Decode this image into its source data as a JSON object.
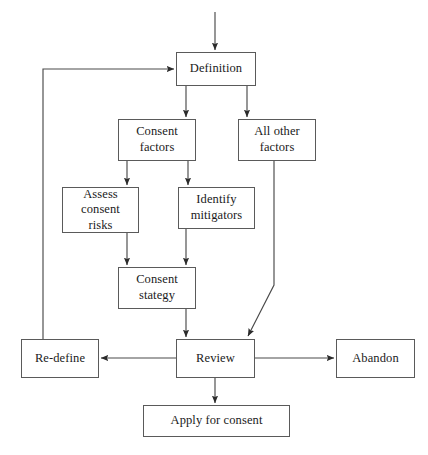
{
  "diagram": {
    "type": "flowchart",
    "orientation": "top-to-bottom",
    "nodes": [
      {
        "id": "definition",
        "label": "Definition",
        "x": 176,
        "y": 52,
        "w": 80,
        "h": 34
      },
      {
        "id": "consent-factors",
        "label": "Consent\nfactors",
        "x": 118,
        "y": 119,
        "w": 78,
        "h": 42
      },
      {
        "id": "all-other-factors",
        "label": "All other\nfactors",
        "x": 238,
        "y": 119,
        "w": 78,
        "h": 42
      },
      {
        "id": "assess-risks",
        "label": "Assess\nconsent\nrisks",
        "x": 62,
        "y": 187,
        "w": 77,
        "h": 46
      },
      {
        "id": "identify-mitigators",
        "label": "Identify\nmitigators",
        "x": 178,
        "y": 187,
        "w": 77,
        "h": 42
      },
      {
        "id": "consent-stategy",
        "label": "Consent\nstategy",
        "x": 118,
        "y": 267,
        "w": 78,
        "h": 42
      },
      {
        "id": "re-define",
        "label": "Re-define",
        "x": 21,
        "y": 339,
        "w": 78,
        "h": 39
      },
      {
        "id": "review",
        "label": "Review",
        "x": 176,
        "y": 339,
        "w": 79,
        "h": 39
      },
      {
        "id": "abandon",
        "label": "Abandon",
        "x": 336,
        "y": 339,
        "w": 79,
        "h": 39
      },
      {
        "id": "apply-for-consent",
        "label": "Apply for consent",
        "x": 143,
        "y": 405,
        "w": 147,
        "h": 32
      }
    ],
    "edges": [
      {
        "id": "entry-to-definition",
        "from": "start",
        "to": "definition",
        "style": "straight-down"
      },
      {
        "id": "definition-to-consent",
        "from": "definition",
        "to": "consent-factors",
        "style": "straight-down"
      },
      {
        "id": "definition-to-allother",
        "from": "definition",
        "to": "all-other-factors",
        "style": "straight-down"
      },
      {
        "id": "consent-to-assess",
        "from": "consent-factors",
        "to": "assess-risks",
        "style": "straight-down"
      },
      {
        "id": "consent-to-identify",
        "from": "consent-factors",
        "to": "identify-mitigators",
        "style": "straight-down"
      },
      {
        "id": "assess-to-stategy",
        "from": "assess-risks",
        "to": "consent-stategy",
        "style": "straight-down"
      },
      {
        "id": "identify-to-stategy",
        "from": "identify-mitigators",
        "to": "consent-stategy",
        "style": "straight-down"
      },
      {
        "id": "stategy-to-review",
        "from": "consent-stategy",
        "to": "review",
        "style": "straight-down"
      },
      {
        "id": "allother-to-review",
        "from": "all-other-factors",
        "to": "review",
        "style": "elbow-diagonal"
      },
      {
        "id": "review-to-redefine",
        "from": "review",
        "to": "re-define",
        "style": "straight-left"
      },
      {
        "id": "review-to-abandon",
        "from": "review",
        "to": "abandon",
        "style": "straight-right"
      },
      {
        "id": "review-to-apply",
        "from": "review",
        "to": "apply-for-consent",
        "style": "straight-down"
      },
      {
        "id": "redefine-to-definition",
        "from": "re-define",
        "to": "definition",
        "style": "feedback-loop"
      }
    ],
    "colors": {
      "background": "#ffffff",
      "box_border": "#5a5a5a",
      "line": "#4a4a4a",
      "text": "#1a1a1a"
    }
  }
}
